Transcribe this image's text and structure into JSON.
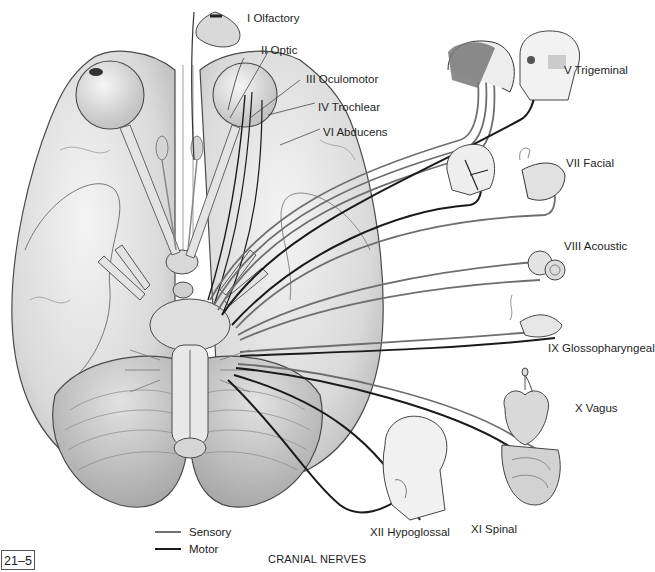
{
  "figure": {
    "number": "21–5",
    "caption": "CRANIAL NERVES"
  },
  "labels": {
    "olfactory": "I Olfactory",
    "optic": "II Optic",
    "oculomotor": "III Oculomotor",
    "trochlear": "IV Trochlear",
    "trigeminal": "V Trigeminal",
    "abducens": "VI Abducens",
    "facial": "VII Facial",
    "acoustic": "VIII Acoustic",
    "glossopharyngeal": "IX Glossopharyngeal",
    "vagus": "X Vagus",
    "spinal": "XI Spinal",
    "hypoglossal": "XII Hypoglossal"
  },
  "legend": {
    "items": [
      {
        "label": "Sensory",
        "color": "#6e6e6e"
      },
      {
        "label": "Motor",
        "color": "#1a1a1a"
      }
    ]
  },
  "colors": {
    "sensory_line": "#6e6e6e",
    "motor_line": "#1a1a1a",
    "tissue_fill": "#e6e6e6",
    "tissue_stroke": "#5a5a5a"
  }
}
